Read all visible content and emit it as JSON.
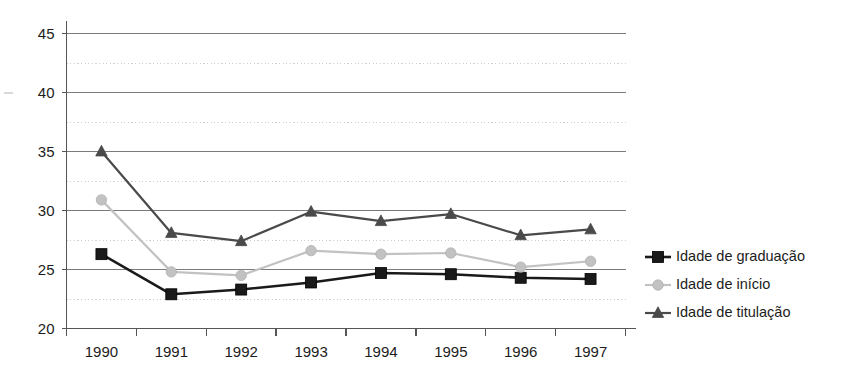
{
  "chart_data": {
    "type": "line",
    "title": "",
    "xlabel": "",
    "ylabel": "",
    "categories": [
      "1990",
      "1991",
      "1992",
      "1993",
      "1994",
      "1995",
      "1996",
      "1997"
    ],
    "x": [
      1990,
      1991,
      1992,
      1993,
      1994,
      1995,
      1996,
      1997
    ],
    "ylim": [
      20,
      45
    ],
    "yticks": [
      20,
      25,
      30,
      35,
      40,
      45
    ],
    "ytick_labels": [
      "20",
      "25",
      "30",
      "35",
      "40",
      "45"
    ],
    "minor_yticks": [
      22.5,
      27.5,
      32.5,
      37.5,
      42.5
    ],
    "grid": "major solid gray, minor dotted light-gray (horizontal only)",
    "legend_position": "right",
    "series": [
      {
        "name": "Idade de graduação",
        "marker": "square",
        "color": "#1a1a1a",
        "values": [
          26.3,
          22.9,
          23.3,
          23.9,
          24.7,
          24.6,
          24.3,
          24.2
        ]
      },
      {
        "name": "Idade  de início",
        "marker": "circle",
        "color": "#c2c2c2",
        "values": [
          30.9,
          24.8,
          24.5,
          26.6,
          26.3,
          26.4,
          25.2,
          25.7
        ]
      },
      {
        "name": "Idade  de titulação",
        "marker": "triangle",
        "color": "#4a4a4a",
        "values": [
          35.0,
          28.1,
          27.4,
          29.9,
          29.1,
          29.7,
          27.9,
          28.4
        ]
      }
    ]
  },
  "axes": {
    "axis_color": "#555555",
    "major_gridline_color": "#7b7b7b",
    "minor_gridline_color": "#cfcfcf"
  },
  "legend": {
    "entries": [
      {
        "label": "Idade de graduação"
      },
      {
        "label": "Idade  de início"
      },
      {
        "label": "Idade  de titulação"
      }
    ]
  }
}
